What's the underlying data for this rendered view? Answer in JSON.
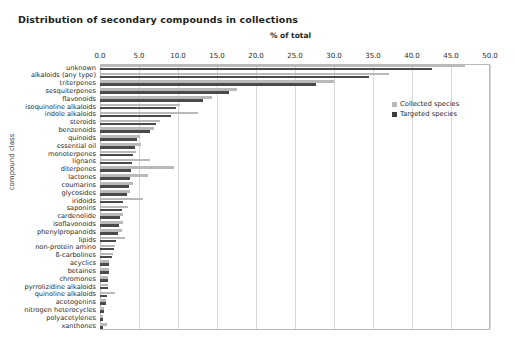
{
  "chart_data": {
    "type": "bar",
    "orientation": "horizontal",
    "title": "Distribution of secondary compounds in collections",
    "xlabel": "% of total",
    "ylabel": "compound class",
    "xlim": [
      0.0,
      50.0
    ],
    "xticks": [
      "0.0",
      "5.0",
      "10.0",
      "15.0",
      "20.0",
      "25.0",
      "30.0",
      "35.0",
      "40.0",
      "45.0",
      "50.0"
    ],
    "grid": true,
    "legend_position": "inside-right",
    "categories": [
      "unknown",
      "alkaloids (any type)",
      "triterpenes",
      "sesquiterpenes",
      "flavonoids",
      "isoquinoline alkaloids",
      "indole alkaloids",
      "steroids",
      "benzenoids",
      "quinoids",
      "essential oil",
      "monoterpenes",
      "lignans",
      "diterpenes",
      "lactones",
      "coumarins",
      "glycosides",
      "iridoids",
      "saponins",
      "cardenolide",
      "isoflavonoids",
      "phenylpropanoids",
      "lipids",
      "non-protein amino",
      "ß-carbolines",
      "acyclics",
      "betaines",
      "chromones",
      "pyrrolizidine alkaloids",
      "quinoline alkaloids",
      "acetogenins",
      "nitrogen heterocycles",
      "polyacetylenes",
      "xanthones"
    ],
    "series": [
      {
        "name": "Collected species",
        "color": "#b9b9b9",
        "values": [
          46.8,
          37.0,
          30.0,
          17.5,
          14.4,
          10.2,
          12.5,
          7.7,
          6.9,
          5.1,
          5.2,
          4.6,
          6.4,
          9.5,
          6.1,
          4.2,
          3.8,
          5.5,
          3.6,
          3.0,
          3.0,
          2.8,
          3.2,
          1.9,
          1.7,
          1.2,
          1.1,
          1.0,
          1.0,
          1.9,
          0.8,
          0.5,
          0.4,
          0.9
        ]
      },
      {
        "name": "Targeted species",
        "color": "#4a4a4a",
        "values": [
          42.5,
          34.5,
          27.7,
          16.5,
          13.2,
          9.8,
          9.1,
          7.2,
          6.4,
          4.8,
          4.5,
          4.2,
          4.1,
          4.0,
          3.8,
          3.7,
          3.5,
          3.0,
          2.8,
          2.5,
          2.4,
          2.3,
          2.1,
          1.8,
          1.6,
          1.2,
          1.1,
          1.0,
          1.0,
          0.9,
          0.8,
          0.5,
          0.4,
          0.4
        ]
      }
    ]
  },
  "legend": {
    "items": [
      {
        "label": "Collected species"
      },
      {
        "label": "Targeted species"
      }
    ]
  }
}
